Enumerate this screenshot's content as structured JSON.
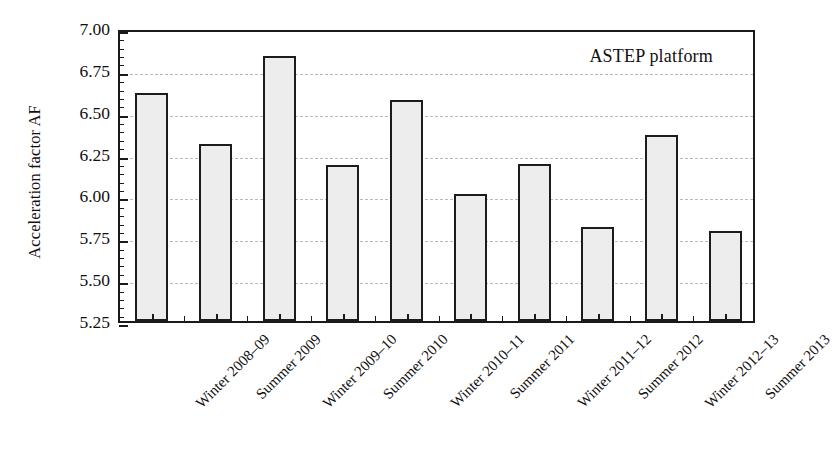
{
  "chart_data": {
    "type": "bar",
    "title": "",
    "annotation": "ASTEP platform",
    "xlabel": "",
    "ylabel": "Acceleration factor AF",
    "ylim": [
      5.25,
      7.0
    ],
    "ytick_labels": [
      "7.00",
      "6.75",
      "6.50",
      "6.25",
      "6.00",
      "5.75",
      "5.50",
      "5.25"
    ],
    "ytick_values": [
      7.0,
      6.75,
      6.5,
      6.25,
      6.0,
      5.75,
      5.5,
      5.25
    ],
    "grid": "horizontal-dashed",
    "legend": "none",
    "categories": [
      "Winter 2008–09",
      "Summer 2009",
      "Winter 2009–10",
      "Summer 2010",
      "Winter 2010–11",
      "Summer 2011",
      "Winter 2011–12",
      "Summer 2012",
      "Winter 2012–13",
      "Summer 2013"
    ],
    "values": [
      6.61,
      6.31,
      6.83,
      6.18,
      6.57,
      6.01,
      6.19,
      5.81,
      6.36,
      5.79
    ],
    "bar_fill_color": "#ededed",
    "bar_edge_color": "#1c1c1c",
    "grid_color": "#b9b9b9",
    "axis_color": "#1a1a1a"
  }
}
